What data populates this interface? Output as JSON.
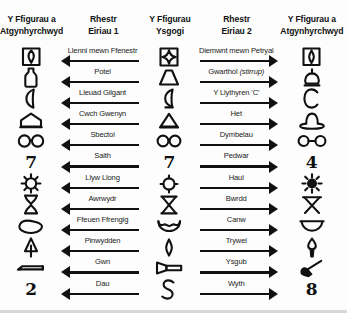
{
  "headers": {
    "col1": "Y Ffigurau a\nAtgynhyrchwyd",
    "col1_line1": "Y Ffigurau a",
    "col1_line2": "Atgynhyrchwyd",
    "col2_line1": "Rhestr",
    "col2_line2": "Eiriau 1",
    "col3_line1": "Y Ffigurau",
    "col3_line2": "Ysgogi",
    "col4_line1": "Rhestr",
    "col4_line2": "Eiriau 2",
    "col5_line1": "Y Ffigurau a",
    "col5_line2": "Atgynhyrchwyd"
  },
  "rows": [
    {
      "left_figure": "square-with-leaf-icon",
      "word1": "Llenni mewn Ffenestr",
      "stimulus_figure": "square-with-four-point-star-icon",
      "word2": "Diemwnt mewn Petryal",
      "word2_italic": "",
      "right_figure": "square-with-diamond-icon"
    },
    {
      "left_figure": "bottle-icon",
      "word1": "Potel",
      "stimulus_figure": "trapezoid-icon",
      "word2": "Gwarthol ",
      "word2_italic": "(stirrup)",
      "right_figure": "stirrup-icon"
    },
    {
      "left_figure": "crescent-moon-icon",
      "word1": "Lleuad Gilgant",
      "stimulus_figure": "crescent-with-line-icon",
      "word2": "Y Llythyren 'C'",
      "word2_italic": "",
      "right_figure": "letter-c-icon"
    },
    {
      "left_figure": "beehive-icon",
      "word1": "Cwch Gwenyn",
      "stimulus_figure": "triangle-with-line-icon",
      "word2": "Het",
      "word2_italic": "",
      "right_figure": "hat-icon"
    },
    {
      "left_figure": "spectacles-icon",
      "word1": "Sbectol",
      "stimulus_figure": "two-circles-icon",
      "word2": "Dymbelau",
      "word2_italic": "",
      "right_figure": "dumbbells-icon"
    },
    {
      "left_figure": "numeral-seven-icon",
      "word1": "Saith",
      "stimulus_figure": "numeral-seven-stimulus-icon",
      "word2": "Pedwar",
      "word2_italic": "",
      "right_figure": "numeral-four-icon"
    },
    {
      "left_figure": "ships-wheel-icon",
      "word1": "Llyw Llong",
      "stimulus_figure": "circle-with-spokes-icon",
      "word2": "Haul",
      "word2_italic": "",
      "right_figure": "sun-icon"
    },
    {
      "left_figure": "hourglass-icon",
      "word1": "Awrwydr",
      "stimulus_figure": "x-cross-icon",
      "word2": "Bwrdd",
      "word2_italic": "",
      "right_figure": "table-icon"
    },
    {
      "left_figure": "kidney-bean-icon",
      "word1": "Ffeuen Ffrengig",
      "stimulus_figure": "curved-bean-icon",
      "word2": "Canw",
      "word2_italic": "",
      "right_figure": "canoe-icon"
    },
    {
      "left_figure": "pine-tree-icon",
      "word1": "Pinwydden",
      "stimulus_figure": "diamond-icon",
      "word2": "Trywel",
      "word2_italic": "",
      "right_figure": "trowel-icon"
    },
    {
      "left_figure": "rifle-icon",
      "word1": "Gwn",
      "stimulus_figure": "funnel-icon",
      "word2": "Ysgub",
      "word2_italic": "",
      "right_figure": "broom-icon"
    },
    {
      "left_figure": "numeral-two-icon",
      "word1": "Dau",
      "stimulus_figure": "s-curve-icon",
      "word2": "Wyth",
      "word2_italic": "",
      "right_figure": "numeral-eight-icon"
    }
  ],
  "colors": {
    "ink": "#111111",
    "background": "#fdfdfd",
    "border": "#d8d8d8"
  }
}
